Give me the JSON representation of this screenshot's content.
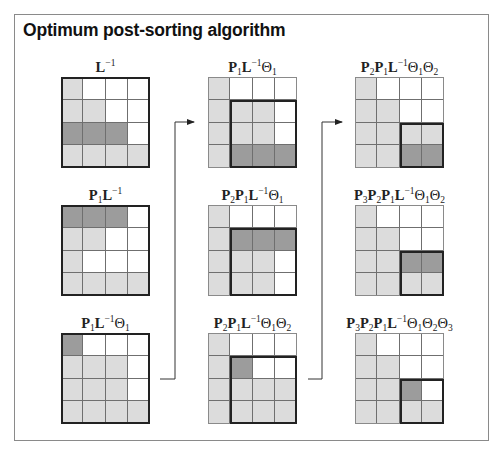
{
  "title": "Optimum post-sorting algorithm",
  "legend": {
    "cell_states": {
      "0": "white",
      "1": "light-gray",
      "2": "dark-gray"
    },
    "colors": {
      "white": "#ffffff",
      "light-gray": "#dcdcdc",
      "dark-gray": "#9c9c9c",
      "grid-line": "#6f6f6f",
      "outline": "#222222"
    }
  },
  "matrices": [
    {
      "id": "m1",
      "label_parts": [
        {
          "t": "L"
        },
        {
          "sup": "−1"
        }
      ],
      "cells": [
        [
          1,
          0,
          0,
          0
        ],
        [
          1,
          1,
          0,
          0
        ],
        [
          2,
          2,
          2,
          0
        ],
        [
          1,
          1,
          1,
          1
        ]
      ],
      "outer_thick": true,
      "box": null
    },
    {
      "id": "m2",
      "label_parts": [
        {
          "t": "P"
        },
        {
          "sub": "1"
        },
        {
          "t": "L"
        },
        {
          "sup": "−1"
        }
      ],
      "cells": [
        [
          2,
          2,
          2,
          0
        ],
        [
          1,
          1,
          0,
          0
        ],
        [
          1,
          0,
          0,
          0
        ],
        [
          1,
          1,
          1,
          1
        ]
      ],
      "outer_thick": true,
      "box": null
    },
    {
      "id": "m3",
      "label_parts": [
        {
          "t": "P"
        },
        {
          "sub": "1"
        },
        {
          "t": "L"
        },
        {
          "sup": "−1"
        },
        {
          "th": "Θ"
        },
        {
          "sub": "1"
        }
      ],
      "cells": [
        [
          2,
          0,
          0,
          0
        ],
        [
          1,
          1,
          1,
          0
        ],
        [
          1,
          1,
          1,
          0
        ],
        [
          1,
          1,
          1,
          1
        ]
      ],
      "outer_thick": true,
      "box": null
    },
    {
      "id": "m4",
      "label_parts": [
        {
          "t": "P"
        },
        {
          "sub": "1"
        },
        {
          "t": "L"
        },
        {
          "sup": "−1"
        },
        {
          "th": "Θ"
        },
        {
          "sub": "1"
        }
      ],
      "cells": [
        [
          1,
          0,
          0,
          0
        ],
        [
          1,
          1,
          1,
          0
        ],
        [
          1,
          1,
          1,
          0
        ],
        [
          1,
          2,
          2,
          2
        ]
      ],
      "outer_thick": false,
      "box": {
        "row": 1,
        "col": 1,
        "size": 3
      }
    },
    {
      "id": "m5",
      "label_parts": [
        {
          "t": "P"
        },
        {
          "sub": "2"
        },
        {
          "t": "P"
        },
        {
          "sub": "1"
        },
        {
          "t": "L"
        },
        {
          "sup": "−1"
        },
        {
          "th": "Θ"
        },
        {
          "sub": "1"
        }
      ],
      "cells": [
        [
          1,
          0,
          0,
          0
        ],
        [
          1,
          2,
          2,
          2
        ],
        [
          1,
          1,
          1,
          0
        ],
        [
          1,
          1,
          1,
          0
        ]
      ],
      "outer_thick": false,
      "box": {
        "row": 1,
        "col": 1,
        "size": 3
      }
    },
    {
      "id": "m6",
      "label_parts": [
        {
          "t": "P"
        },
        {
          "sub": "2"
        },
        {
          "t": "P"
        },
        {
          "sub": "1"
        },
        {
          "t": "L"
        },
        {
          "sup": "−1"
        },
        {
          "th": "Θ"
        },
        {
          "sub": "1"
        },
        {
          "th": "Θ"
        },
        {
          "sub": "2"
        }
      ],
      "cells": [
        [
          1,
          0,
          0,
          0
        ],
        [
          1,
          2,
          0,
          0
        ],
        [
          1,
          1,
          1,
          1
        ],
        [
          1,
          1,
          1,
          1
        ]
      ],
      "outer_thick": false,
      "box": {
        "row": 1,
        "col": 1,
        "size": 3
      }
    },
    {
      "id": "m7",
      "label_parts": [
        {
          "t": "P"
        },
        {
          "sub": "2"
        },
        {
          "t": "P"
        },
        {
          "sub": "1"
        },
        {
          "t": "L"
        },
        {
          "sup": "−1"
        },
        {
          "th": "Θ"
        },
        {
          "sub": "1"
        },
        {
          "th": "Θ"
        },
        {
          "sub": "2"
        }
      ],
      "cells": [
        [
          1,
          0,
          0,
          0
        ],
        [
          1,
          1,
          0,
          0
        ],
        [
          1,
          1,
          1,
          1
        ],
        [
          1,
          1,
          2,
          2
        ]
      ],
      "outer_thick": false,
      "box": {
        "row": 2,
        "col": 2,
        "size": 2
      }
    },
    {
      "id": "m8",
      "label_parts": [
        {
          "t": "P"
        },
        {
          "sub": "3"
        },
        {
          "t": "P"
        },
        {
          "sub": "2"
        },
        {
          "t": "P"
        },
        {
          "sub": "1"
        },
        {
          "t": "L"
        },
        {
          "sup": "−1"
        },
        {
          "th": "Θ"
        },
        {
          "sub": "1"
        },
        {
          "th": "Θ"
        },
        {
          "sub": "2"
        }
      ],
      "cells": [
        [
          1,
          0,
          0,
          0
        ],
        [
          1,
          1,
          0,
          0
        ],
        [
          1,
          1,
          2,
          2
        ],
        [
          1,
          1,
          1,
          1
        ]
      ],
      "outer_thick": false,
      "box": {
        "row": 2,
        "col": 2,
        "size": 2
      }
    },
    {
      "id": "m9",
      "label_parts": [
        {
          "t": "P"
        },
        {
          "sub": "3"
        },
        {
          "t": "P"
        },
        {
          "sub": "2"
        },
        {
          "t": "P"
        },
        {
          "sub": "1"
        },
        {
          "t": "L"
        },
        {
          "sup": "−1"
        },
        {
          "th": "Θ"
        },
        {
          "sub": "1"
        },
        {
          "th": "Θ"
        },
        {
          "sub": "2"
        },
        {
          "th": "Θ"
        },
        {
          "sub": "3"
        }
      ],
      "cells": [
        [
          1,
          0,
          0,
          0
        ],
        [
          1,
          1,
          0,
          0
        ],
        [
          1,
          1,
          2,
          0
        ],
        [
          1,
          1,
          1,
          1
        ]
      ],
      "outer_thick": false,
      "box": {
        "row": 2,
        "col": 2,
        "size": 2
      }
    }
  ],
  "flow": [
    {
      "from": "m3",
      "to": "m4"
    },
    {
      "from": "m6",
      "to": "m7"
    }
  ]
}
